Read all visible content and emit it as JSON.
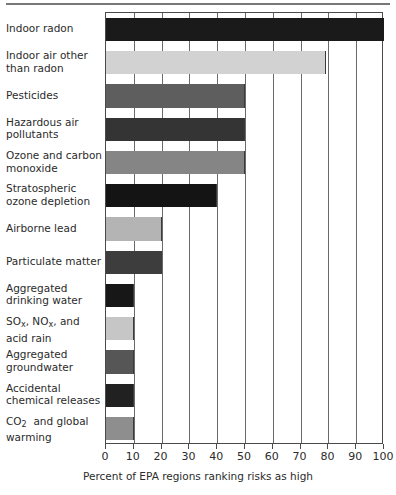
{
  "chart_data": {
    "type": "bar",
    "orientation": "horizontal",
    "title": "",
    "xlabel": "Percent of EPA regions ranking risks as high",
    "ylabel": "",
    "xlim": [
      0,
      100
    ],
    "xticks": [
      0,
      10,
      20,
      30,
      40,
      50,
      60,
      70,
      80,
      90,
      100
    ],
    "xticklabels": [
      "0",
      "10",
      "20",
      "30",
      "40",
      "50",
      "60",
      "70",
      "80",
      "90",
      "100"
    ],
    "grid": true,
    "grid_axis": "x",
    "legend": false,
    "categories": [
      "Indoor radon",
      "Indoor air other than radon",
      "Pesticides",
      "Hazardous air pollutants",
      "Ozone and carbon monoxide",
      "Stratospheric ozone depletion",
      "Airborne lead",
      "Particulate matter",
      "Aggregated drinking water",
      "SOx, NOx, and acid rain",
      "Aggregated groundwater",
      "Accidental chemical releases",
      "CO2 and global warming"
    ],
    "values": [
      100,
      79,
      50,
      50,
      50,
      40,
      20,
      20,
      10,
      10,
      10,
      10,
      10
    ],
    "bars": [
      {
        "label_line1": "Indoor radon",
        "label_line2": "",
        "value": 100,
        "color": "#1a1a1a"
      },
      {
        "label_line1": "Indoor air other",
        "label_line2": "than radon",
        "value": 79,
        "color": "#d2d2d2"
      },
      {
        "label_line1": "Pesticides",
        "label_line2": "",
        "value": 50,
        "color": "#5e5e5e"
      },
      {
        "label_line1": "Hazardous air",
        "label_line2": "pollutants",
        "value": 50,
        "color": "#343434"
      },
      {
        "label_line1": "Ozone and carbon",
        "label_line2": "monoxide",
        "value": 50,
        "color": "#858585"
      },
      {
        "label_line1": "Stratospheric",
        "label_line2": "ozone depletion",
        "value": 40,
        "color": "#141414"
      },
      {
        "label_line1": "Airborne lead",
        "label_line2": "",
        "value": 20,
        "color": "#b4b4b4"
      },
      {
        "label_line1": "Particulate matter",
        "label_line2": "",
        "value": 20,
        "color": "#3d3d3d"
      },
      {
        "label_line1": "Aggregated",
        "label_line2": "drinking water",
        "value": 10,
        "color": "#171717"
      },
      {
        "label_line1": "SOx_SUB, NOx_SUB, and",
        "label_line2": "acid rain",
        "value": 10,
        "color": "#c6c6c6"
      },
      {
        "label_line1": "Aggregated",
        "label_line2": "groundwater",
        "value": 10,
        "color": "#565656"
      },
      {
        "label_line1": "Accidental",
        "label_line2": "chemical releases",
        "value": 10,
        "color": "#212121"
      },
      {
        "label_line1": "CO2_SUB and global",
        "label_line2": "warming",
        "value": 10,
        "color": "#8e8e8e"
      }
    ]
  },
  "axis": {
    "x_title": "Percent of EPA regions ranking risks as high",
    "x_min": 0,
    "x_max": 100,
    "x_tick_step": 10
  },
  "style": {
    "axis_color": "#4a4a4a",
    "grid_color": "#6a6a6a",
    "text_color": "#2b2b2b",
    "background": "#ffffff",
    "rule_color": "#777777"
  }
}
